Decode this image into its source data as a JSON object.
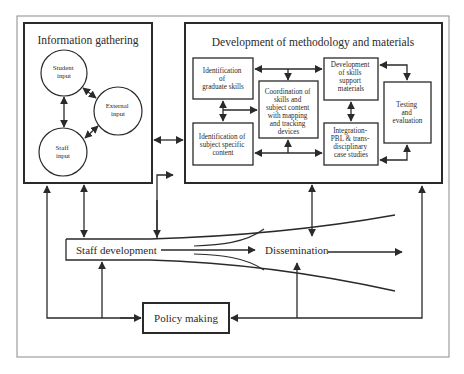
{
  "diagram": {
    "type": "flowchart",
    "information_gathering": {
      "title": "Information gathering",
      "nodes": {
        "student": [
          "Student",
          "input"
        ],
        "external": [
          "External",
          "input"
        ],
        "staff": [
          "Staff",
          "input"
        ]
      }
    },
    "development": {
      "title": "Development of methodology and materials",
      "nodes": {
        "graduate_skills": [
          "Identification",
          "of",
          "graduate skills"
        ],
        "subject_content": [
          "Identification of",
          "subject specific",
          "content"
        ],
        "coordination": [
          "Coordination of",
          "skills and",
          "subject content",
          "with mapping",
          "and tracking",
          "devices"
        ],
        "skills_support": [
          "Development",
          "of skills",
          "support",
          "materials"
        ],
        "integration": [
          "Integration-",
          "PBL & trans-",
          "disciplinary",
          "case studies"
        ],
        "testing": [
          "Testing",
          "and",
          "evaluation"
        ]
      }
    },
    "staff_development": "Staff development",
    "dissemination": "Dissemination",
    "policy_making": "Policy making",
    "colors": {
      "stroke": "#2a2a2a",
      "frame": "#8a8a8a",
      "background": "#ffffff"
    }
  }
}
